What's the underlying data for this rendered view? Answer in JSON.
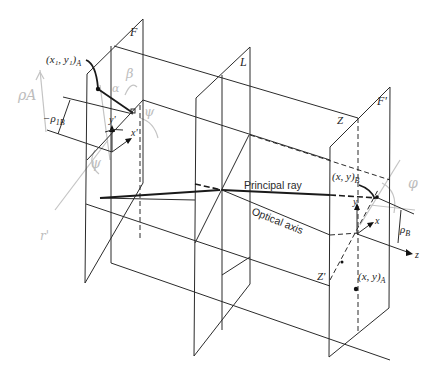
{
  "figure": {
    "planes": {
      "F": "F",
      "L": "L",
      "F_prime": "F'"
    },
    "points": {
      "Z": "Z",
      "Z_prime": "Z'"
    },
    "labels": {
      "x1y1A": "(x₁, y₁)A",
      "x1y1A_main": "(x₁, y₁)",
      "x1y1A_sub": "A",
      "rho_1B_main": "−ρ",
      "rho_1B_sub": "1B",
      "x_prime": "x'",
      "y_prime": "y'",
      "xyB_main": "(x, y)",
      "xyB_sub": "B",
      "xyA_main": "(x, y)",
      "xyA_sub": "A",
      "x_axis": "x",
      "y_axis": "y",
      "z_axis": "z",
      "rho_B_main": "ρ",
      "rho_B_sub": "B",
      "principal_ray": "Principal ray",
      "optical_axis": "Optical axis"
    },
    "pencil_annotations": {
      "rho_A": "ρA",
      "r_prime": "r'",
      "beta": "β",
      "alpha": "α",
      "psi_left": "ψ",
      "psi_upper": "ψ",
      "phi_right": "φ"
    },
    "colors": {
      "ink": "#2b2b2b",
      "pencil": "#c4c4c4",
      "background": "#ffffff"
    }
  }
}
